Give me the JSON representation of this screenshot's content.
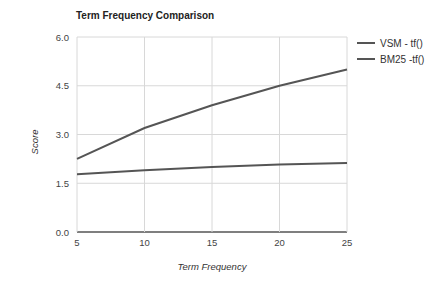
{
  "chart_data": {
    "type": "line",
    "title": "Term Frequency Comparison",
    "xlabel": "Term Frequency",
    "ylabel": "Score",
    "x": [
      5,
      10,
      15,
      20,
      25
    ],
    "xticks": [
      "5",
      "10",
      "15",
      "20",
      "25"
    ],
    "yticks": [
      "0.0",
      "1.5",
      "3.0",
      "4.5",
      "6.0"
    ],
    "ylim": [
      0,
      6
    ],
    "xlim": [
      5,
      25
    ],
    "grid": true,
    "legend_position": "right",
    "series": [
      {
        "name": "VSM - tf()",
        "values": [
          2.25,
          3.2,
          3.9,
          4.5,
          5.0
        ],
        "color": "#555555"
      },
      {
        "name": "BM25 -tf()",
        "values": [
          1.78,
          1.9,
          2.0,
          2.08,
          2.12
        ],
        "color": "#555555"
      }
    ]
  }
}
